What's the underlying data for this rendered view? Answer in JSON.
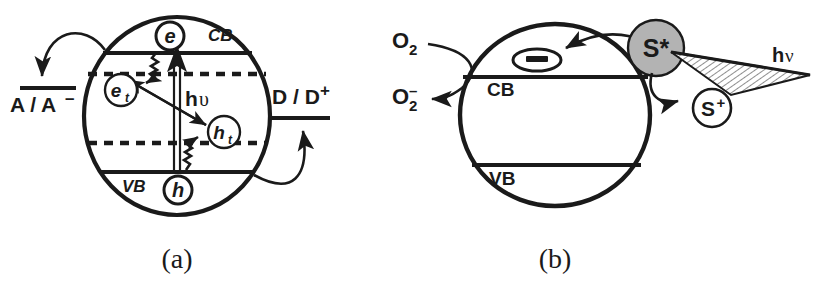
{
  "figure": {
    "background_color": "#ffffff",
    "ink_color": "#1a1a1a",
    "sphere_fill_color": "#b3b3b3",
    "width": 831,
    "height": 296
  },
  "panels": [
    {
      "id": "a",
      "caption": "(a)",
      "description": "Semiconductor particle band diagram with trap states, band gap excitation and interfacial charge transfer",
      "particle_label": "semiconductor-particle",
      "bands": {
        "conduction_band_label": "CB",
        "valence_band_label": "VB",
        "electron_trap_level": "dashed",
        "hole_trap_level": "dashed"
      },
      "carriers": [
        {
          "name": "conduction-band-electron",
          "label": "e"
        },
        {
          "name": "trapped-electron",
          "label": "e",
          "subscript": "t"
        },
        {
          "name": "trapped-hole",
          "label": "h",
          "subscript": "t"
        },
        {
          "name": "valence-band-hole",
          "label": "h"
        }
      ],
      "excitation_label": "h",
      "excitation_symbol": "υ",
      "redox_couples": [
        {
          "name": "acceptor-couple",
          "label": "A / A",
          "charge": "–",
          "position": "left"
        },
        {
          "name": "donor-couple",
          "label": "D / D",
          "charge": "+",
          "position": "right"
        }
      ],
      "processes": [
        "band-gap-excitation",
        "electron-trapping",
        "hole-trapping",
        "electron-hole-recombination",
        "electron-transfer-to-acceptor",
        "hole-transfer-to-donor"
      ]
    },
    {
      "id": "b",
      "caption": "(b)",
      "description": "Dye-sensitized semiconductor particle: excited sensitizer injects an electron into the conduction band which reduces oxygen",
      "particle_label": "semiconductor-particle",
      "bands": {
        "conduction_band_label": "CB",
        "valence_band_label": "VB"
      },
      "injected_electron_label": "–",
      "sensitizer": {
        "excited_label": "S*",
        "oxidized_label": "S",
        "oxidized_charge": "+"
      },
      "oxygen": {
        "neutral_label": "O",
        "neutral_subscript": "2",
        "radical_label": "O",
        "radical_subscript": "2",
        "radical_charge": "–"
      },
      "excitation_label": "h",
      "excitation_symbol": "ν",
      "processes": [
        "photon-absorption-by-sensitizer",
        "electron-injection-into-conduction-band",
        "sensitizer-oxidation",
        "oxygen-reduction"
      ]
    }
  ]
}
